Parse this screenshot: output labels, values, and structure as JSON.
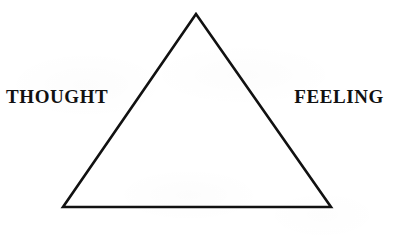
{
  "diagram": {
    "background_color": "#ffffff",
    "stroke_color": "#111111",
    "text_color": "#111111",
    "stroke_width": 2.6,
    "canvas": {
      "width": 393,
      "height": 250
    },
    "shape": {
      "name": "triangle",
      "type": "isosceles-triangle",
      "vertices": [
        {
          "id": "apex",
          "x": 196,
          "y": 14
        },
        {
          "id": "bottom-left",
          "x": 63,
          "y": 207
        },
        {
          "id": "bottom-right",
          "x": 331,
          "y": 207
        }
      ]
    },
    "labels": {
      "left": "THOUGHT",
      "right": "FEELING"
    }
  }
}
